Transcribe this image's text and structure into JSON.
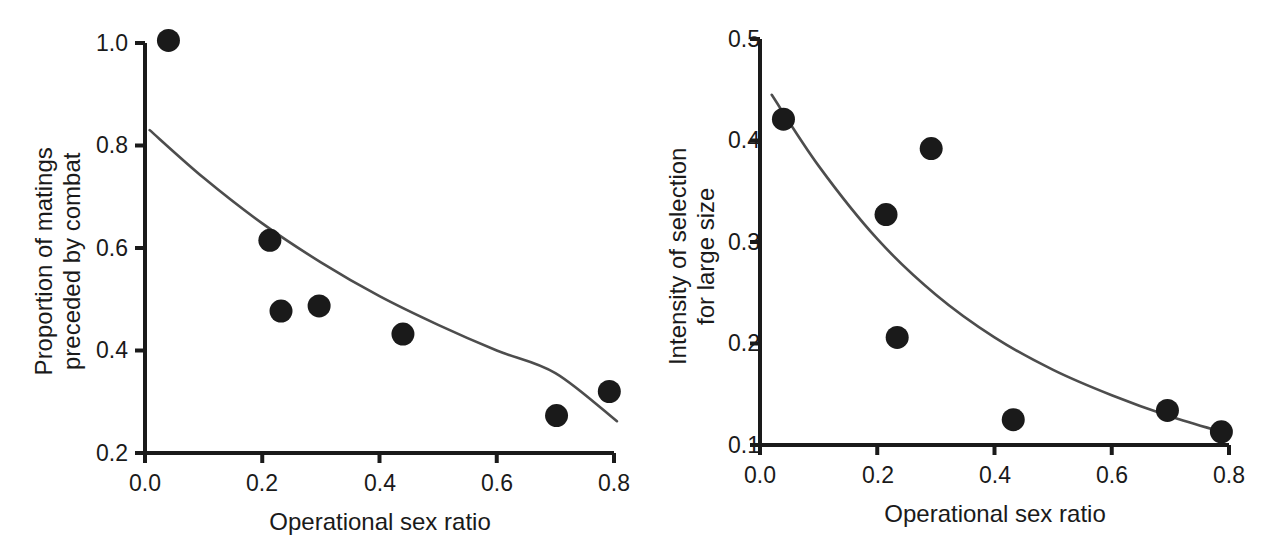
{
  "figure": {
    "background": "#ffffff",
    "ink_color": "#1a1a1a",
    "curve_color": "#4d4d4d",
    "marker_color": "#1a1a1a"
  },
  "chart_data": [
    {
      "panel": "left",
      "type": "scatter",
      "title": "",
      "xlabel": "Operational sex ratio",
      "ylabel": "Proportion of matings preceded by combat",
      "ylabel_line1": "Proportion of matings",
      "ylabel_line2": "preceded by combat",
      "xlim": [
        0.0,
        0.8
      ],
      "ylim": [
        0.2,
        1.0
      ],
      "xticks": [
        0.0,
        0.2,
        0.4,
        0.6,
        0.8
      ],
      "xtick_labels": [
        "0.0",
        "0.2",
        "0.4",
        "0.6",
        "0.8"
      ],
      "yticks": [
        0.2,
        0.4,
        0.6,
        0.8,
        1.0
      ],
      "ytick_labels": [
        "0.2",
        "0.4",
        "0.6",
        "0.8",
        "1.0"
      ],
      "grid": false,
      "legend": "none",
      "points": [
        {
          "x": 0.04,
          "y": 1.005
        },
        {
          "x": 0.213,
          "y": 0.615
        },
        {
          "x": 0.232,
          "y": 0.477
        },
        {
          "x": 0.297,
          "y": 0.487
        },
        {
          "x": 0.44,
          "y": 0.432
        },
        {
          "x": 0.702,
          "y": 0.273
        },
        {
          "x": 0.792,
          "y": 0.32
        }
      ],
      "fit_curve": {
        "kind": "exponential-decay",
        "x_start": 0.008,
        "x_end": 0.805,
        "y_start": 0.83,
        "y_end": 0.262,
        "points": [
          {
            "x": 0.008,
            "y": 0.83
          },
          {
            "x": 0.1,
            "y": 0.737
          },
          {
            "x": 0.2,
            "y": 0.648
          },
          {
            "x": 0.3,
            "y": 0.572
          },
          {
            "x": 0.4,
            "y": 0.506
          },
          {
            "x": 0.5,
            "y": 0.45
          },
          {
            "x": 0.6,
            "y": 0.4
          },
          {
            "x": 0.7,
            "y": 0.356
          },
          {
            "x": 0.805,
            "y": 0.262
          }
        ]
      }
    },
    {
      "panel": "right",
      "type": "scatter",
      "title": "",
      "xlabel": "Operational sex ratio",
      "ylabel": "Intensity of selection for large size",
      "ylabel_line1": "Intensity of selection",
      "ylabel_line2": "for large size",
      "xlim": [
        0.0,
        0.8
      ],
      "ylim": [
        0.1,
        0.5
      ],
      "xticks": [
        0.0,
        0.2,
        0.4,
        0.6,
        0.8
      ],
      "xtick_labels": [
        "0.0",
        "0.2",
        "0.4",
        "0.6",
        "0.8"
      ],
      "yticks": [
        0.1,
        0.2,
        0.3,
        0.4,
        0.5
      ],
      "ytick_labels": [
        "0.1",
        "0.2",
        "0.3",
        "0.4",
        "0.5"
      ],
      "grid": false,
      "legend": "none",
      "points": [
        {
          "x": 0.04,
          "y": 0.421
        },
        {
          "x": 0.215,
          "y": 0.327
        },
        {
          "x": 0.234,
          "y": 0.206
        },
        {
          "x": 0.292,
          "y": 0.392
        },
        {
          "x": 0.432,
          "y": 0.125
        },
        {
          "x": 0.695,
          "y": 0.134
        },
        {
          "x": 0.787,
          "y": 0.113
        }
      ],
      "fit_curve": {
        "kind": "exponential-decay",
        "x_start": 0.02,
        "x_end": 0.793,
        "y_start": 0.445,
        "y_end": 0.112,
        "points": [
          {
            "x": 0.02,
            "y": 0.445
          },
          {
            "x": 0.1,
            "y": 0.375
          },
          {
            "x": 0.2,
            "y": 0.303
          },
          {
            "x": 0.3,
            "y": 0.248
          },
          {
            "x": 0.4,
            "y": 0.206
          },
          {
            "x": 0.5,
            "y": 0.174
          },
          {
            "x": 0.6,
            "y": 0.149
          },
          {
            "x": 0.7,
            "y": 0.128
          },
          {
            "x": 0.793,
            "y": 0.112
          }
        ]
      }
    }
  ]
}
